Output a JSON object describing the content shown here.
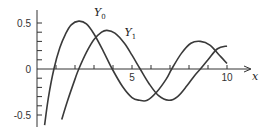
{
  "chart_data": {
    "type": "line",
    "title": "",
    "xlabel": "x",
    "ylabel": "",
    "xlim": [
      0,
      11.5
    ],
    "ylim": [
      -0.6,
      0.6
    ],
    "x_ticks": [
      1,
      2,
      3,
      4,
      5,
      6,
      7,
      8,
      9,
      10
    ],
    "x_tick_labels": [
      {
        "value": 5,
        "label": "5"
      },
      {
        "value": 10,
        "label": "10"
      }
    ],
    "y_ticks": [
      -0.5,
      -0.4,
      -0.3,
      -0.2,
      -0.1,
      0.1,
      0.2,
      0.3,
      0.4,
      0.5
    ],
    "y_tick_labels": [
      {
        "value": 0.5,
        "label": "0.5"
      },
      {
        "value": 0,
        "label": "0"
      },
      {
        "value": -0.5,
        "label": "-0.5"
      }
    ],
    "grid": false,
    "legend": "inline labels",
    "series": [
      {
        "name": "Y0",
        "label_main": "Y",
        "label_sub": "0",
        "label_pos": {
          "x": 3.0,
          "y": 0.58
        },
        "x": [
          0.4,
          0.6,
          0.89,
          1.2,
          1.5,
          1.8,
          2.2,
          2.6,
          3.0,
          3.5,
          3.96,
          4.5,
          5.0,
          5.4,
          5.8,
          6.3,
          6.8,
          7.09,
          7.6,
          8.1,
          8.6,
          9.1,
          9.6,
          10.0
        ],
        "values": [
          -0.61,
          -0.31,
          0.0,
          0.23,
          0.38,
          0.48,
          0.52,
          0.49,
          0.38,
          0.19,
          0.0,
          -0.19,
          -0.31,
          -0.34,
          -0.34,
          -0.25,
          -0.11,
          0.0,
          0.17,
          0.28,
          0.3,
          0.26,
          0.15,
          0.06
        ]
      },
      {
        "name": "Y1",
        "label_main": "Y",
        "label_sub": "1",
        "label_pos": {
          "x": 4.6,
          "y": 0.36
        },
        "x": [
          1.3,
          1.6,
          2.0,
          2.2,
          2.6,
          3.0,
          3.4,
          3.68,
          4.1,
          4.6,
          5.0,
          5.43,
          5.9,
          6.4,
          6.94,
          7.4,
          7.9,
          8.3,
          8.6,
          9.0,
          9.5,
          10.0
        ],
        "values": [
          -0.55,
          -0.35,
          -0.11,
          0.0,
          0.18,
          0.32,
          0.4,
          0.42,
          0.39,
          0.28,
          0.15,
          0.0,
          -0.16,
          -0.29,
          -0.34,
          -0.3,
          -0.18,
          -0.07,
          0.0,
          0.1,
          0.22,
          0.25
        ]
      }
    ]
  }
}
